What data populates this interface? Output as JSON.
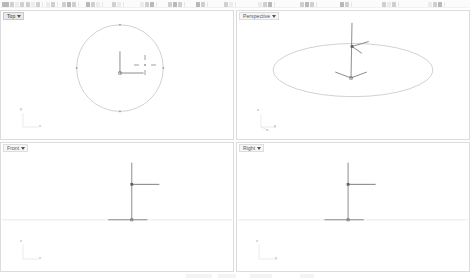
{
  "app": {
    "title": "3D Modeling Application",
    "background_color": "#ffffff",
    "panel_border_color": "#dcdcdc"
  },
  "toolbar": {
    "rows": 1,
    "groups": [
      {
        "x": 2,
        "icons": [
          "new-file-icon",
          "open-folder-icon",
          "save-icon",
          "print-icon"
        ]
      },
      {
        "x": 26,
        "icons": [
          "cut-icon",
          "copy-icon",
          "paste-icon"
        ]
      },
      {
        "x": 46,
        "icons": [
          "undo-icon",
          "redo-icon"
        ]
      },
      {
        "x": 62,
        "icons": [
          "select-icon",
          "deselect-icon",
          "invert-selection-icon"
        ]
      },
      {
        "x": 86,
        "icons": [
          "zoom-extents-icon",
          "zoom-window-icon",
          "pan-icon"
        ]
      },
      {
        "x": 112,
        "icons": [
          "layer-icon",
          "properties-icon"
        ]
      },
      {
        "x": 140,
        "icons": [
          "point-icon",
          "line-icon",
          "curve-icon"
        ]
      },
      {
        "x": 168,
        "icons": [
          "circle-icon",
          "arc-icon",
          "ellipse-icon"
        ]
      },
      {
        "x": 196,
        "icons": [
          "rectangle-icon",
          "polygon-icon"
        ]
      },
      {
        "x": 224,
        "icons": [
          "surface-icon",
          "extrude-icon"
        ]
      },
      {
        "x": 258,
        "icons": [
          "mesh-icon",
          "solid-icon",
          "boolean-icon"
        ]
      },
      {
        "x": 300,
        "icons": [
          "transform-move-icon",
          "rotate-icon",
          "scale-icon"
        ]
      },
      {
        "x": 340,
        "icons": [
          "mirror-icon",
          "array-icon"
        ]
      },
      {
        "x": 382,
        "icons": [
          "trim-icon",
          "split-icon",
          "join-icon"
        ]
      },
      {
        "x": 428,
        "icons": [
          "render-icon",
          "shade-icon",
          "help-icon"
        ]
      }
    ]
  },
  "viewports": [
    {
      "id": "top",
      "label": "Top",
      "dropdown_arrow": "chevron-down-icon",
      "active": true,
      "axis_labels": {
        "vertical": "y",
        "horizontal": "x"
      },
      "geometry": {
        "type": "circle",
        "center_x": 120,
        "center_y": 58,
        "radius": 44,
        "stroke": "#b9b9b9"
      },
      "gizmo": {
        "type": "axis-gizmo-2d",
        "origin_x": 120,
        "origin_y": 63,
        "arm_length": 22,
        "stroke": "#6e6e6e"
      },
      "cursor": {
        "type": "crosshair-move-cursor",
        "x": 143,
        "y": 45
      }
    },
    {
      "id": "perspective",
      "label": "Perspective",
      "dropdown_arrow": "chevron-down-icon",
      "active": false,
      "axis_labels": {
        "vertical": "z",
        "horizontal": "y",
        "depth": "x"
      },
      "geometry": {
        "type": "ellipse",
        "center_x": 117,
        "center_y": 60,
        "radius_x": 81,
        "radius_y": 27,
        "stroke": "#b9b9b9"
      },
      "gizmo": {
        "type": "axis-gizmo-3d",
        "top_x": 116,
        "top_y": 36,
        "bottom_x": 115,
        "bottom_y": 68,
        "stroke": "#6e6e6e"
      }
    },
    {
      "id": "front",
      "label": "Front",
      "dropdown_arrow": "chevron-down-icon",
      "active": false,
      "axis_labels": {
        "vertical": "z",
        "horizontal": "x"
      },
      "geometry": {
        "type": "ground-line",
        "y": 78,
        "stroke": "#dcdcdc"
      },
      "gizmo": {
        "type": "axis-gizmo-2d-vertical",
        "origin_x": 132,
        "origin_y": 78,
        "top_y": 22,
        "node_y": 42,
        "arm_length": 26,
        "stroke": "#6e6e6e"
      }
    },
    {
      "id": "right",
      "label": "Right",
      "dropdown_arrow": "chevron-down-icon",
      "active": false,
      "axis_labels": {
        "vertical": "z",
        "horizontal": "y"
      },
      "geometry": {
        "type": "ground-line",
        "y": 78,
        "stroke": "#dcdcdc"
      },
      "gizmo": {
        "type": "axis-gizmo-2d-vertical",
        "origin_x": 112,
        "origin_y": 78,
        "top_y": 22,
        "node_y": 42,
        "arm_length": 26,
        "stroke": "#6e6e6e"
      }
    }
  ],
  "statusbar": {
    "segments": [
      {
        "x": 186,
        "width": 26
      },
      {
        "x": 218,
        "width": 18
      },
      {
        "x": 250,
        "width": 22
      },
      {
        "x": 300,
        "width": 14
      }
    ]
  }
}
